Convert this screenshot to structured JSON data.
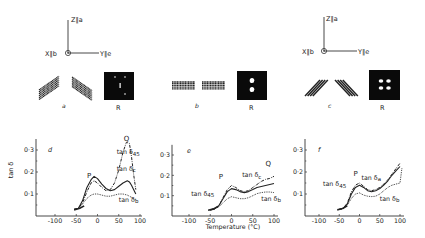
{
  "figure": {
    "orientations": [
      {
        "id": "a",
        "axes": {
          "z_label": "Z∥a",
          "x_label": "X∥b",
          "y_label": "Y∥e"
        },
        "lamella_label": "a",
        "pattern_label": "R",
        "pattern": "four-point"
      },
      {
        "id": "b",
        "axes": null,
        "lamella_label": "b",
        "pattern_label": "R",
        "pattern": "two-point-meridional"
      },
      {
        "id": "c",
        "axes": {
          "z_label": "Z∥a",
          "x_label": "X∥b",
          "y_label": "Y∥e"
        },
        "lamella_label": "c",
        "pattern_label": "R",
        "pattern": "four-lobe"
      }
    ],
    "shared_xlabel": "Temperature (°C)",
    "shared_ylabel": "tan δ"
  },
  "chart_data": [
    {
      "type": "line",
      "panel_label": "d",
      "title": "",
      "xlabel": "",
      "ylabel": "tan δ",
      "xlim": [
        -130,
        100
      ],
      "ylim": [
        0,
        0.35
      ],
      "xticks": [
        "-100",
        "-50",
        "0",
        "50",
        "100"
      ],
      "xtick_values": [
        -100,
        -50,
        0,
        50,
        100
      ],
      "yticks": [
        "0·1",
        "0·2",
        "0·3"
      ],
      "ytick_values": [
        0.1,
        0.2,
        0.3
      ],
      "annotations": [
        {
          "text": "P",
          "x": -25,
          "y": 0.175
        },
        {
          "text": "Q",
          "x": 62,
          "y": 0.34
        }
      ],
      "series": [
        {
          "name": "tan δ45",
          "style": "dash-dot",
          "x": [
            -55,
            -45,
            -35,
            -25,
            -15,
            -8,
            0,
            10,
            20,
            30,
            40,
            50,
            60,
            68,
            75,
            80,
            85,
            90
          ],
          "y": [
            0.03,
            0.035,
            0.06,
            0.11,
            0.15,
            0.16,
            0.15,
            0.13,
            0.115,
            0.12,
            0.15,
            0.21,
            0.29,
            0.335,
            0.33,
            0.27,
            0.19,
            0.12
          ]
        },
        {
          "name": "tan δc",
          "style": "solid",
          "x": [
            -55,
            -45,
            -35,
            -25,
            -15,
            -8,
            0,
            10,
            20,
            30,
            40,
            50,
            60,
            70,
            75,
            80,
            90
          ],
          "y": [
            0.03,
            0.035,
            0.07,
            0.13,
            0.165,
            0.18,
            0.17,
            0.145,
            0.125,
            0.115,
            0.12,
            0.135,
            0.15,
            0.16,
            0.155,
            0.14,
            0.1
          ]
        },
        {
          "name": "tan δb",
          "style": "dotted",
          "x": [
            -55,
            -45,
            -35,
            -25,
            -15,
            -8,
            0,
            10,
            20,
            30,
            40,
            50,
            60,
            70,
            80,
            90
          ],
          "y": [
            0.03,
            0.035,
            0.055,
            0.08,
            0.095,
            0.1,
            0.1,
            0.095,
            0.09,
            0.09,
            0.095,
            0.1,
            0.1,
            0.095,
            0.085,
            0.075
          ]
        }
      ]
    },
    {
      "type": "line",
      "panel_label": "e",
      "title": "",
      "xlabel": "Temperature (°C)",
      "ylabel": "",
      "xlim": [
        -135,
        100
      ],
      "ylim": [
        0,
        0.35
      ],
      "xticks": [
        "-100",
        "-50",
        "0",
        "50",
        "100"
      ],
      "xtick_values": [
        -100,
        -50,
        0,
        50,
        100
      ],
      "yticks": [
        "0·1",
        "0·2",
        "0·3"
      ],
      "ytick_values": [
        0.1,
        0.2,
        0.3
      ],
      "annotations": [
        {
          "text": "P",
          "x": -30,
          "y": 0.18
        },
        {
          "text": "Q",
          "x": 80,
          "y": 0.245
        }
      ],
      "series": [
        {
          "name": "tan δc",
          "style": "dash-dot",
          "x": [
            -50,
            -40,
            -30,
            -20,
            -10,
            0,
            10,
            20,
            30,
            40,
            50,
            60,
            70,
            80,
            90,
            100
          ],
          "y": [
            0.03,
            0.035,
            0.05,
            0.09,
            0.13,
            0.15,
            0.14,
            0.125,
            0.12,
            0.125,
            0.14,
            0.155,
            0.17,
            0.18,
            0.185,
            0.195
          ]
        },
        {
          "name": "tan δ45",
          "style": "solid",
          "x": [
            -50,
            -40,
            -30,
            -20,
            -10,
            0,
            10,
            20,
            30,
            40,
            50,
            60,
            70,
            80,
            90,
            100
          ],
          "y": [
            0.03,
            0.035,
            0.05,
            0.085,
            0.12,
            0.135,
            0.13,
            0.12,
            0.115,
            0.12,
            0.13,
            0.14,
            0.145,
            0.15,
            0.155,
            0.16
          ]
        },
        {
          "name": "tan δb",
          "style": "dotted",
          "x": [
            -50,
            -40,
            -30,
            -20,
            -10,
            0,
            10,
            20,
            30,
            40,
            50,
            60,
            70,
            80,
            90,
            100
          ],
          "y": [
            0.03,
            0.035,
            0.045,
            0.065,
            0.085,
            0.095,
            0.09,
            0.085,
            0.085,
            0.09,
            0.1,
            0.11,
            0.115,
            0.118,
            0.118,
            0.115
          ]
        }
      ]
    },
    {
      "type": "line",
      "panel_label": "f",
      "title": "",
      "xlabel": "",
      "ylabel": "",
      "xlim": [
        -135,
        110
      ],
      "ylim": [
        0,
        0.35
      ],
      "xticks": [
        "-100",
        "-50",
        "0",
        "50",
        "100"
      ],
      "xtick_values": [
        -100,
        -50,
        0,
        50,
        100
      ],
      "yticks": [
        "0·1",
        "0·2",
        "0·3"
      ],
      "ytick_values": [
        0.1,
        0.2,
        0.3
      ],
      "annotations": [
        {
          "text": "P",
          "x": -15,
          "y": 0.18
        }
      ],
      "series": [
        {
          "name": "tan δa",
          "style": "dash-dot",
          "x": [
            -50,
            -40,
            -30,
            -20,
            -10,
            0,
            10,
            20,
            30,
            40,
            50,
            60,
            70,
            80,
            90,
            100
          ],
          "y": [
            0.03,
            0.035,
            0.06,
            0.11,
            0.14,
            0.15,
            0.135,
            0.12,
            0.115,
            0.12,
            0.13,
            0.145,
            0.165,
            0.19,
            0.215,
            0.24
          ]
        },
        {
          "name": "tan δ45",
          "style": "solid",
          "x": [
            -50,
            -40,
            -30,
            -20,
            -10,
            0,
            10,
            20,
            30,
            40,
            50,
            60,
            70,
            80,
            90,
            100
          ],
          "y": [
            0.03,
            0.035,
            0.055,
            0.1,
            0.13,
            0.14,
            0.13,
            0.115,
            0.11,
            0.115,
            0.125,
            0.14,
            0.16,
            0.185,
            0.205,
            0.225
          ]
        },
        {
          "name": "tan δb",
          "style": "dotted",
          "x": [
            -50,
            -40,
            -30,
            -20,
            -10,
            0,
            10,
            20,
            30,
            40,
            50,
            60,
            70,
            80,
            90,
            100,
            105
          ],
          "y": [
            0.03,
            0.033,
            0.05,
            0.08,
            0.1,
            0.105,
            0.095,
            0.09,
            0.088,
            0.09,
            0.1,
            0.115,
            0.13,
            0.14,
            0.145,
            0.15,
            0.22
          ]
        }
      ]
    }
  ],
  "series_labels": {
    "d": [
      {
        "text": "tan δ45",
        "x": 45,
        "y": 0.28
      },
      {
        "text": "tan δc",
        "x": 45,
        "y": 0.205
      },
      {
        "text": "tan δb",
        "x": 50,
        "y": 0.065
      }
    ],
    "e": [
      {
        "text": "tan δc",
        "x": 25,
        "y": 0.19
      },
      {
        "text": "tan δ45",
        "x": -95,
        "y": 0.1
      },
      {
        "text": "tan δb",
        "x": 70,
        "y": 0.075
      }
    ],
    "f": [
      {
        "text": "tan δ45",
        "x": -90,
        "y": 0.135
      },
      {
        "text": "tan δa",
        "x": 5,
        "y": 0.165
      },
      {
        "text": "tan δb",
        "x": 50,
        "y": 0.07
      }
    ]
  },
  "colors": {
    "ink": "#222222",
    "background": "#ffffff",
    "pattern_bg": "#0a0a0a",
    "pattern_spot": "#ffffff"
  }
}
